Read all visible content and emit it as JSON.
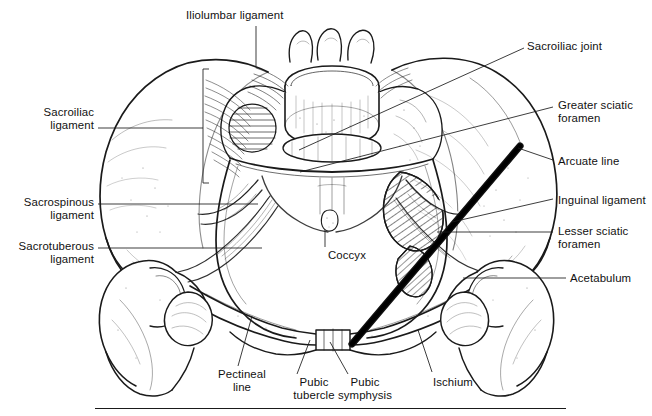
{
  "figure": {
    "background_color": "#ffffff",
    "ink_color": "#111111",
    "rule": {
      "name": "bottom-rule",
      "x1": 95,
      "x2": 566,
      "y": 408
    }
  },
  "labels": [
    {
      "id": "iliolumbar-ligament",
      "text": "Iliolumbar ligament",
      "x": 186,
      "y": 9,
      "align": "left",
      "leader": [
        [
          256,
          26
        ],
        [
          256,
          66
        ]
      ]
    },
    {
      "id": "sacroiliac-joint",
      "text": "Sacroiliac joint",
      "x": 527,
      "y": 40,
      "align": "left",
      "leader": [
        [
          524,
          48
        ],
        [
          299,
          150
        ]
      ]
    },
    {
      "id": "greater-sciatic-foramen",
      "text": "Greater sciatic\nforamen",
      "x": 558,
      "y": 99,
      "align": "left",
      "leader": [
        [
          553,
          107
        ],
        [
          300,
          172
        ]
      ]
    },
    {
      "id": "arcuate-line",
      "text": "Arcuate line",
      "x": 558,
      "y": 155,
      "align": "left",
      "leader": [
        [
          553,
          160
        ],
        [
          518,
          148
        ]
      ]
    },
    {
      "id": "inguinal-ligament",
      "text": "Inguinal ligament",
      "x": 558,
      "y": 194,
      "align": "left",
      "leader": [
        [
          553,
          199
        ],
        [
          452,
          222
        ]
      ]
    },
    {
      "id": "lesser-sciatic-foramen",
      "text": "Lesser sciatic\nforamen",
      "x": 558,
      "y": 225,
      "align": "left",
      "leader": [
        [
          553,
          232
        ],
        [
          437,
          232
        ]
      ]
    },
    {
      "id": "acetabulum",
      "text": "Acetabulum",
      "x": 570,
      "y": 272,
      "align": "left",
      "leader": [
        [
          566,
          278
        ],
        [
          463,
          278
        ]
      ]
    },
    {
      "id": "sacroiliac-ligament",
      "text": "Sacroiliac\nligament",
      "x": 94,
      "y": 106,
      "align": "right",
      "leader": [
        [
          98,
          128
        ],
        [
          203,
          128
        ]
      ],
      "bracket": {
        "x": 203,
        "y1": 69,
        "y2": 183
      }
    },
    {
      "id": "sacrospinous-ligament",
      "text": "Sacrospinous\nligament",
      "x": 94,
      "y": 196,
      "align": "right",
      "leader": [
        [
          98,
          204
        ],
        [
          258,
          204
        ]
      ]
    },
    {
      "id": "sacrotuberous-ligament",
      "text": "Sacrotuberous\nligament",
      "x": 94,
      "y": 240,
      "align": "right",
      "leader": [
        [
          98,
          248
        ],
        [
          262,
          248
        ]
      ]
    },
    {
      "id": "coccyx",
      "text": "Coccyx",
      "x": 305,
      "y": 249,
      "align": "center",
      "leader": [
        [
          325,
          247
        ],
        [
          325,
          230
        ]
      ]
    },
    {
      "id": "pectineal-line",
      "text": "Pectineal\nline",
      "x": 200,
      "y": 368,
      "align": "center",
      "leader": [
        [
          238,
          366
        ],
        [
          252,
          316
        ]
      ]
    },
    {
      "id": "pubic-tubercle",
      "text": "Pubic\ntubercle",
      "x": 272,
      "y": 376,
      "align": "center",
      "leader": [
        [
          297,
          374
        ],
        [
          310,
          340
        ]
      ]
    },
    {
      "id": "pubic-symphysis",
      "text": "Pubic\nsymphysis",
      "x": 323,
      "y": 376,
      "align": "center",
      "leader": [
        [
          348,
          374
        ],
        [
          330,
          342
        ]
      ]
    },
    {
      "id": "ischium",
      "text": "Ischium",
      "x": 411,
      "y": 376,
      "align": "center",
      "leader": [
        [
          432,
          372
        ],
        [
          418,
          330
        ]
      ]
    }
  ]
}
